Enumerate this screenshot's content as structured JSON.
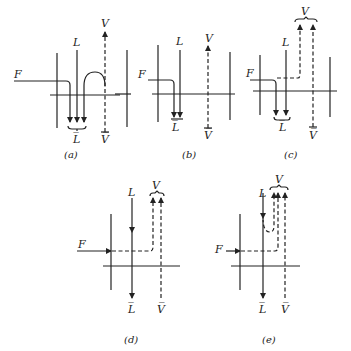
{
  "figure": {
    "panels": [
      {
        "id": "a",
        "caption": "(a)",
        "feed": "F",
        "liquid_in": "L",
        "liquid_out": "L̅",
        "vapor_in": "V̅",
        "vapor_out": "V"
      },
      {
        "id": "b",
        "caption": "(b)",
        "feed": "F",
        "liquid_in": "L",
        "liquid_out": "L̅",
        "vapor_in": "V̅",
        "vapor_out": "V"
      },
      {
        "id": "c",
        "caption": "(c)",
        "feed": "F",
        "liquid_in": "L",
        "liquid_out": "L̅",
        "vapor_in": "V̅",
        "vapor_out": "V"
      },
      {
        "id": "d",
        "caption": "(d)",
        "feed": "F",
        "liquid_in": "L",
        "liquid_out": "L̅",
        "vapor_in": "V̅",
        "vapor_out": "V"
      },
      {
        "id": "e",
        "caption": "(e)",
        "feed": "F",
        "liquid_in": "L",
        "liquid_out": "L̅",
        "vapor_in": "V̅",
        "vapor_out": "V"
      }
    ]
  }
}
